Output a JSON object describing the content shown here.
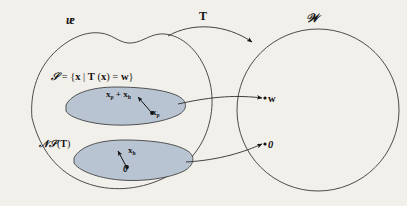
{
  "figure": {
    "type": "linear-algebra-mapping-diagram",
    "background_color": "#f2f0eb",
    "ink_color": "#131313",
    "blob_fill_color": "#b9c4d2"
  },
  "domain_set": {
    "name": "V",
    "label": "ᵫ",
    "label_plain": "V"
  },
  "codomain_set": {
    "name": "W",
    "label": "𝒲",
    "label_plain": "W"
  },
  "transformation": {
    "label": "T",
    "description": "linear transformation arrow from V to W"
  },
  "solution_set": {
    "label": "𝒮 = {x | T (x) = w}",
    "set_name": "S",
    "condition": "T (x) = w"
  },
  "null_space": {
    "label": "𝒩𝒮(T)",
    "label_plain": "NS(T)"
  },
  "vectors": {
    "particular_plus_homogeneous": {
      "base": "x",
      "sub": "p",
      "operator": "+",
      "base2": "x",
      "sub2": "h"
    },
    "particular": {
      "base": "x",
      "sub": "p"
    },
    "homogeneous": {
      "base": "x",
      "sub": "h"
    },
    "zero_domain": "0",
    "zero_codomain": "0"
  },
  "images": {
    "w_label": "w",
    "zero_label": "0"
  }
}
